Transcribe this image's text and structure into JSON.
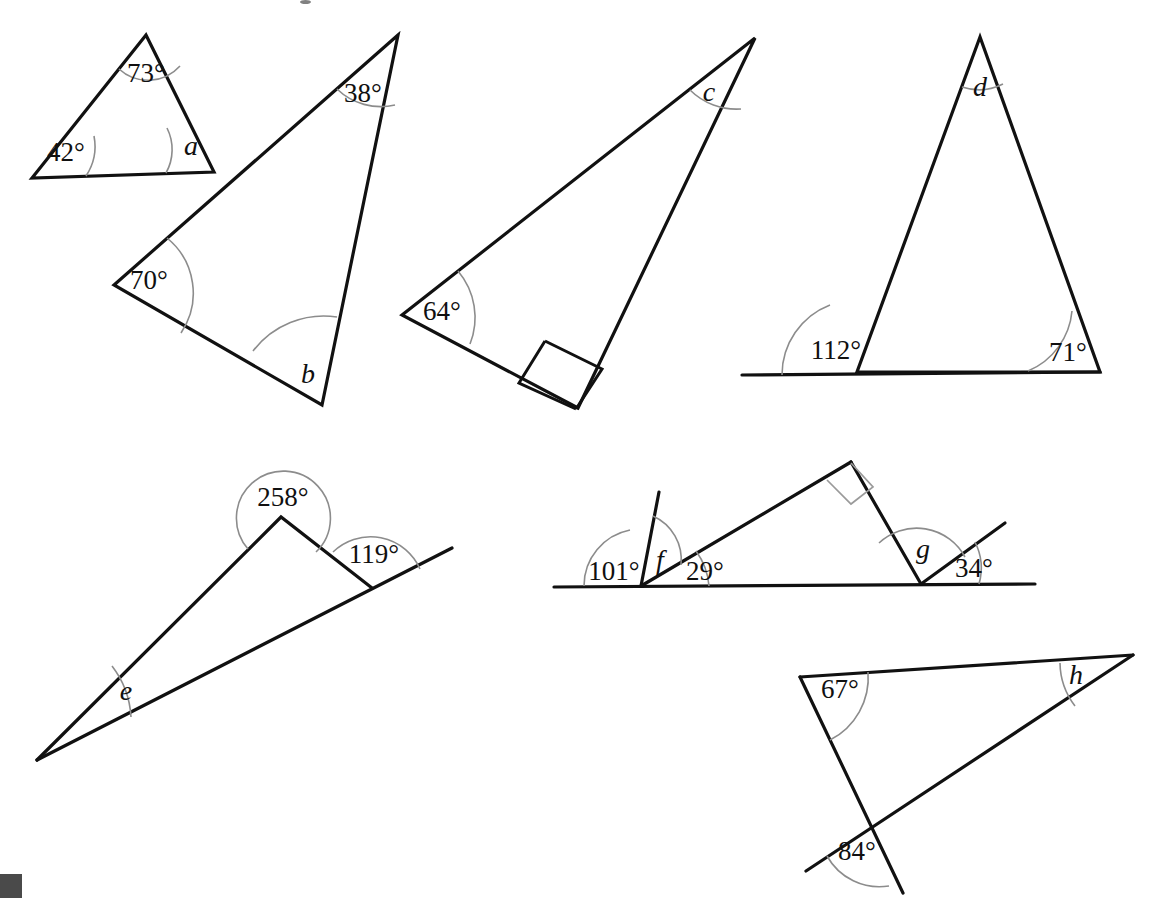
{
  "page": {
    "background_color": "#ffffff",
    "line_color": "#111111",
    "arc_color": "#8c8c8c",
    "corner_block_color": "#4a4a4a",
    "width": 1159,
    "height": 898
  },
  "figures": [
    {
      "id": "figure-1",
      "name": "triangle-a",
      "description": "Triangle with two known angles and unknown angle a",
      "labels": [
        {
          "key": "top",
          "text": "73°",
          "kind": "value",
          "x": 146,
          "y": 76
        },
        {
          "key": "bottom_left",
          "text": "42°",
          "kind": "value",
          "x": 66,
          "y": 155
        },
        {
          "key": "bottom_right",
          "text": "a",
          "kind": "variable",
          "x": 191,
          "y": 149
        }
      ]
    },
    {
      "id": "figure-2",
      "name": "triangle-b",
      "description": "Large triangle with 38 degrees, 70 degrees and unknown angle b",
      "labels": [
        {
          "key": "top",
          "text": "38°",
          "kind": "value",
          "x": 363,
          "y": 96
        },
        {
          "key": "left",
          "text": "70°",
          "kind": "value",
          "x": 149,
          "y": 283
        },
        {
          "key": "bottom",
          "text": "b",
          "kind": "variable",
          "x": 308,
          "y": 377
        }
      ]
    },
    {
      "id": "figure-3",
      "name": "right-triangle-c",
      "description": "Right-angled triangle with 64 degrees and unknown angle c",
      "labels": [
        {
          "key": "top",
          "text": "c",
          "kind": "variable",
          "x": 709,
          "y": 95
        },
        {
          "key": "left",
          "text": "64°",
          "kind": "value",
          "x": 442,
          "y": 314
        },
        {
          "key": "right_angle",
          "text": "right-angle-square",
          "kind": "marker",
          "x": 567,
          "y": 373
        }
      ]
    },
    {
      "id": "figure-4",
      "name": "triangle-d",
      "description": "Triangle on a base line with exterior angle 112 degrees, 71 degrees and unknown apex angle d",
      "labels": [
        {
          "key": "apex",
          "text": "d",
          "kind": "variable",
          "x": 980,
          "y": 90
        },
        {
          "key": "bottom_left_exterior",
          "text": "112°",
          "kind": "value",
          "x": 836,
          "y": 353
        },
        {
          "key": "bottom_right",
          "text": "71°",
          "kind": "value",
          "x": 1068,
          "y": 355
        }
      ]
    },
    {
      "id": "figure-5",
      "name": "reflex-angle-e",
      "description": "Narrow triangle with a reflex angle of 258 degrees, exterior angle 119 degrees and unknown angle e",
      "labels": [
        {
          "key": "reflex",
          "text": "258°",
          "kind": "value",
          "x": 283,
          "y": 500
        },
        {
          "key": "right",
          "text": "119°",
          "kind": "value",
          "x": 374,
          "y": 557
        },
        {
          "key": "left",
          "text": "e",
          "kind": "variable",
          "x": 126,
          "y": 694
        }
      ]
    },
    {
      "id": "figure-6",
      "name": "angles-on-line-f-g",
      "description": "Angles on a straight line with a right-angled triangle; unknown angles f and g",
      "labels": [
        {
          "key": "left_obtuse",
          "text": "101°",
          "kind": "value",
          "x": 614,
          "y": 574
        },
        {
          "key": "f",
          "text": "f",
          "kind": "variable",
          "x": 659,
          "y": 563
        },
        {
          "key": "base_left",
          "text": "29°",
          "kind": "value",
          "x": 703,
          "y": 574
        },
        {
          "key": "g",
          "text": "g",
          "kind": "variable",
          "x": 923,
          "y": 552
        },
        {
          "key": "right",
          "text": "34°",
          "kind": "value",
          "x": 974,
          "y": 571
        },
        {
          "key": "right_angle",
          "text": "right-angle-square",
          "kind": "marker",
          "x": 845,
          "y": 486
        }
      ]
    },
    {
      "id": "figure-7",
      "name": "crossed-lines-h",
      "description": "Crossed lines forming a triangle with 67 degrees, 84 degrees and unknown angle h",
      "labels": [
        {
          "key": "top_left",
          "text": "67°",
          "kind": "value",
          "x": 840,
          "y": 692
        },
        {
          "key": "top_right",
          "text": "h",
          "kind": "variable",
          "x": 1076,
          "y": 678
        },
        {
          "key": "crossing",
          "text": "84°",
          "kind": "value",
          "x": 857,
          "y": 854
        }
      ]
    }
  ]
}
